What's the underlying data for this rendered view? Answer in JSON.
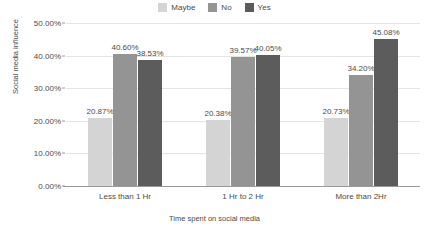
{
  "chart_data": {
    "type": "bar",
    "title": "",
    "xlabel": "Time spent on social media",
    "ylabel": "Social media influence",
    "categories": [
      "Less than 1 Hr",
      "1 Hr to 2 Hr",
      "More than 2Hr"
    ],
    "ylim": [
      0,
      50
    ],
    "ytick_labels": [
      "50.00%",
      "40.00%",
      "30.00%",
      "20.00%",
      "10.00%",
      "0.00%"
    ],
    "ytick_values": [
      50,
      40,
      30,
      20,
      10,
      0
    ],
    "grid": true,
    "legend_position": "top-center",
    "series": [
      {
        "name": "Maybe",
        "color": "#d4d4d4",
        "values": [
          20.87,
          20.38,
          20.73
        ],
        "labels": [
          "20.87%",
          "20.38%",
          "20.73%"
        ]
      },
      {
        "name": "No",
        "color": "#949494",
        "values": [
          40.6,
          39.57,
          34.2
        ],
        "labels": [
          "40.60%",
          "39.57%",
          "34.20%"
        ]
      },
      {
        "name": "Yes",
        "color": "#5c5c5c",
        "values": [
          38.53,
          40.05,
          45.08
        ],
        "labels": [
          "38.53%",
          "40.05%",
          "45.08%"
        ]
      }
    ]
  }
}
